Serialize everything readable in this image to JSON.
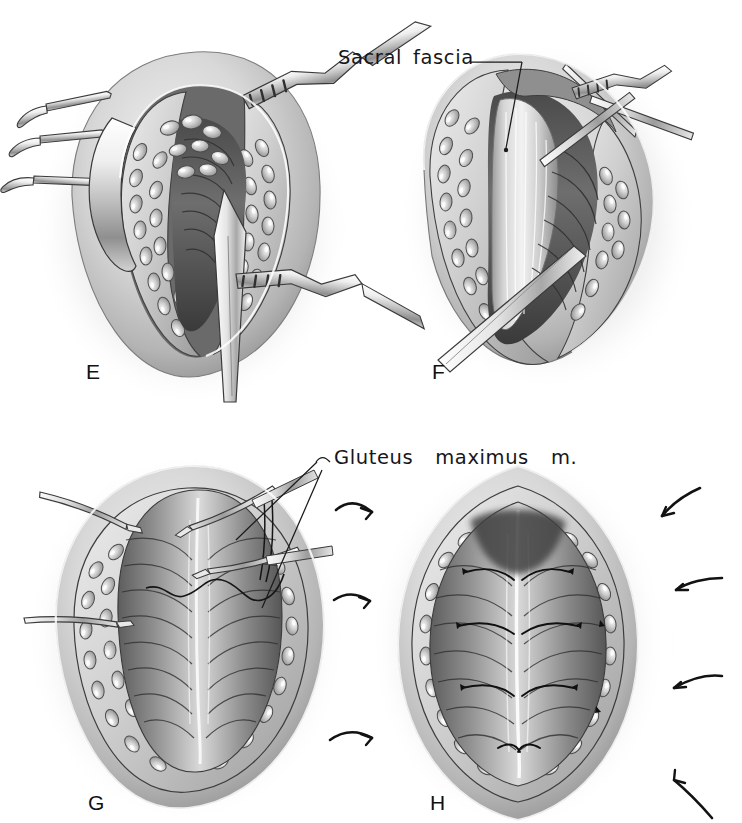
{
  "plate": {
    "kind": "surgical-illustration-plate",
    "background_color": "#ffffff",
    "ink_color": "#16161a",
    "medium": "graphite / wash, grayscale",
    "panel_count": 4
  },
  "panels": [
    {
      "letter": "E",
      "letter_x": 86,
      "letter_y": 361,
      "caption": "Rake and right-angle retractors hold the subcutaneous fat apart; the knife incises the midline raphe down to the sacral fascia",
      "center_x": 190,
      "center_y": 230,
      "width": 320,
      "height": 340,
      "instruments": [
        "four-prong rake retractor",
        "four-prong rake retractor",
        "four-prong rake retractor",
        "richardson-retractor",
        "richardson-retractor",
        "scalpel"
      ],
      "tissues": [
        "skin-edge",
        "subcutaneous-fat",
        "sacral-fascia",
        "muscle"
      ]
    },
    {
      "letter": "F",
      "letter_x": 432,
      "letter_y": 361,
      "caption": "The wound edges are retracted obliquely exposing the glistening sacral fascia; the knife continues the fascial split",
      "center_x": 548,
      "center_y": 220,
      "width": 300,
      "height": 340,
      "instruments": [
        "rake-retractor",
        "rake-retractor",
        "richardson-retractor",
        "scalpel"
      ],
      "tissues": [
        "skin-edge",
        "subcutaneous-fat",
        "sacral-fascia",
        "muscle"
      ]
    },
    {
      "letter": "G",
      "letter_x": 88,
      "letter_y": 792,
      "caption": "Hemostats grasp the fascial edges while the first approximating suture is passed through the gluteus maximus muscle",
      "center_x": 185,
      "center_y": 640,
      "width": 330,
      "height": 350,
      "instruments": [
        "hemostat",
        "hemostat",
        "hemostat",
        "hemostat",
        "suture-needle",
        "suture-thread"
      ],
      "tissues": [
        "skin-edge",
        "subcutaneous-fat",
        "gluteus-maximus-muscle"
      ]
    },
    {
      "letter": "H",
      "letter_x": 430,
      "letter_y": 792,
      "caption": "Interrupted sutures approximate the gluteus maximus muscle bellies in the midline; curved arrows indicate the direction of closure",
      "center_x": 518,
      "center_y": 645,
      "width": 290,
      "height": 360,
      "instruments": [
        "interrupted-suture",
        "interrupted-suture",
        "interrupted-suture",
        "interrupted-suture",
        "interrupted-suture",
        "interrupted-suture"
      ],
      "tissues": [
        "skin-edge",
        "subcutaneous-fat",
        "gluteus-maximus-muscle"
      ]
    }
  ],
  "annotations": [
    {
      "id": "sacral-fascia",
      "text_part_1": "Sacral",
      "text_part_2": "fascia",
      "text_full": "Sacral fascia",
      "x": 338,
      "y": 48,
      "leader": {
        "x1": 468,
        "y1": 62,
        "x2": 520,
        "y2": 62,
        "x3": 534,
        "y3": 72
      },
      "points_to_panel": "F"
    },
    {
      "id": "gluteus-maximus-m",
      "text_part_1": "Gluteus",
      "text_part_2": "maximus",
      "text_part_3": "m.",
      "text_full": "Gluteus maximus m.",
      "x": 330,
      "y": 448,
      "leader_left_hook": {
        "x1": 330,
        "y1": 462,
        "x2": 322,
        "y2": 456
      },
      "leaders": [
        {
          "x1": 322,
          "y1": 462,
          "x2": 232,
          "y2": 540
        },
        {
          "x1": 322,
          "y1": 470,
          "x2": 258,
          "y2": 600
        }
      ],
      "points_to_panel": "G"
    }
  ],
  "closure_arrows": {
    "description": "curved tapered ink arrows showing direction of wound closure around panel H",
    "count": 8,
    "items": [
      {
        "id": "arrow-left-upper",
        "x": 340,
        "y": 500,
        "direction": "right"
      },
      {
        "id": "arrow-left-mid",
        "x": 335,
        "y": 592,
        "direction": "right"
      },
      {
        "id": "arrow-left-lower",
        "x": 332,
        "y": 730,
        "direction": "right"
      },
      {
        "id": "arrow-right-upper",
        "x": 615,
        "y": 492,
        "direction": "left"
      },
      {
        "id": "arrow-right-mid",
        "x": 625,
        "y": 580,
        "direction": "left"
      },
      {
        "id": "arrow-right-low",
        "x": 625,
        "y": 668,
        "direction": "left"
      },
      {
        "id": "arrow-right-bottom",
        "x": 640,
        "y": 775,
        "direction": "upleft"
      },
      {
        "id": "arrow-left-bottom",
        "x": 338,
        "y": 735,
        "direction": "right"
      }
    ]
  }
}
